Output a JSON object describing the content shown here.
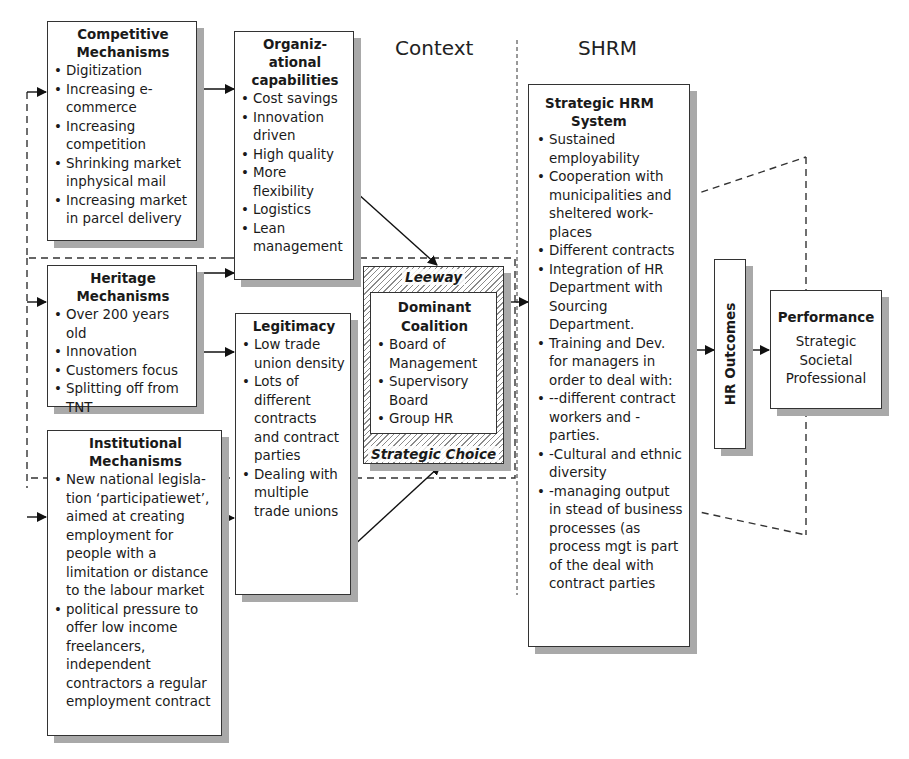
{
  "section_labels": {
    "context": "Context",
    "shrm": "SHRM"
  },
  "competitive": {
    "title_line1": "Competitive",
    "title_line2": "Mechanisms",
    "items": [
      "Digitization",
      "Increasing e-commerce",
      "Increasing competition",
      "Shrinking market inphysical mail",
      "Increasing market in parcel delivery"
    ]
  },
  "heritage": {
    "title_line1": "Heritage",
    "title_line2": "Mechanisms",
    "items": [
      "Over 200 years old",
      "Innovation",
      "Customers focus",
      "Splitting off from TNT"
    ]
  },
  "institutional": {
    "title_line1": "Institutional",
    "title_line2": "Mechanisms",
    "items": [
      "New national legisla-tion ‘participatiewet’, aimed at creating employment for people with a limitation or distance to the labour market",
      "political pressure to offer low income freelancers, independent contractors a regular employment contract"
    ]
  },
  "org_capabilities": {
    "title_line1": "Organiz-",
    "title_line2": "ational",
    "title_line3": "capabilities",
    "items": [
      "Cost savings",
      "Innovation driven",
      "High quality",
      "More flexibility",
      "Logistics",
      "Lean management"
    ]
  },
  "legitimacy": {
    "title": "Legitimacy",
    "items": [
      "Low trade union density",
      "Lots of different contracts and contract parties",
      "Dealing with multiple trade unions"
    ]
  },
  "dominant_coalition": {
    "leeway_label": "Leeway",
    "strategic_choice_label": "Strategic Choice",
    "title_line1": "Dominant",
    "title_line2": "Coalition",
    "items": [
      "Board of Management",
      "Supervisory Board",
      "Group HR"
    ]
  },
  "shrm_system": {
    "title_line1": "Strategic HRM",
    "title_line2": "System",
    "items": [
      "Sustained employability",
      "Cooperation with municipalities and sheltered work-places",
      "Different contracts",
      "Integration of HR Department with Sourcing Department.",
      "Training and Dev. for managers in order to deal with:",
      "--different contract workers and -parties.",
      "-Cultural and ethnic diversity",
      "-managing output in stead of business processes (as process mgt is part of the deal with contract parties"
    ]
  },
  "hr_outcomes": {
    "label": "HR Outcomes"
  },
  "performance": {
    "title": "Performance",
    "lines": [
      "Strategic",
      "Societal",
      "Professional"
    ]
  },
  "colors": {
    "line": "#333333",
    "shadow": "#a9a9a9",
    "background": "#ffffff"
  }
}
